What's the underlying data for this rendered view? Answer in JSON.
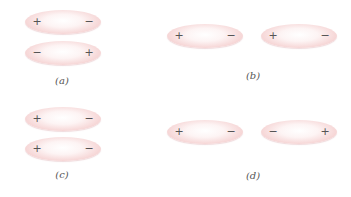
{
  "panels": [
    {
      "label": "(a)",
      "molecules": [
        {
          "left_charge": "+",
          "right_charge": "−"
        },
        {
          "left_charge": "−",
          "right_charge": "+"
        }
      ]
    },
    {
      "label": "(b)",
      "molecules": [
        {
          "left_charge": "+",
          "right_charge": "−"
        },
        {
          "left_charge": "+",
          "right_charge": "−"
        }
      ]
    },
    {
      "label": "(c)",
      "molecules": [
        {
          "left_charge": "+",
          "right_charge": "−"
        },
        {
          "left_charge": "+",
          "right_charge": "−"
        }
      ]
    },
    {
      "label": "(d)",
      "molecules": [
        {
          "left_charge": "+",
          "right_charge": "−"
        },
        {
          "left_charge": "−",
          "right_charge": "+"
        }
      ]
    }
  ],
  "colors": {
    "molecule_edge": "#eab4b8",
    "molecule_center": "#ffffff",
    "text": "#555555"
  }
}
